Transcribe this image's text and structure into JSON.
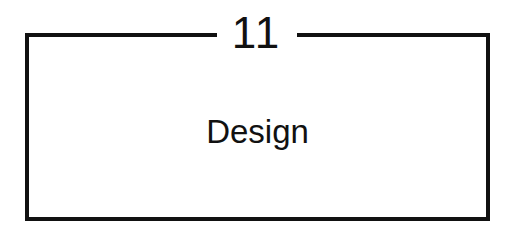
{
  "card": {
    "number": "11",
    "title": "Design"
  },
  "colors": {
    "border": "#111111",
    "text": "#111111",
    "background": "#ffffff"
  }
}
